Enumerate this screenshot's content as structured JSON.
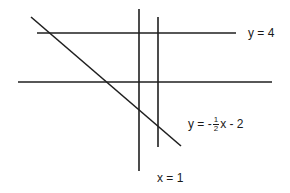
{
  "diagram": {
    "stroke_color": "#1f1f1f",
    "lines": [
      {
        "id": "line-y4",
        "x1": 37,
        "y1": 33,
        "x2": 236,
        "y2": 33
      },
      {
        "id": "line-x-axis",
        "x1": 18,
        "y1": 82,
        "x2": 272,
        "y2": 82
      },
      {
        "id": "line-y-axis",
        "x1": 139,
        "y1": 9,
        "x2": 139,
        "y2": 171
      },
      {
        "id": "line-x1",
        "x1": 158,
        "y1": 17,
        "x2": 158,
        "y2": 147
      },
      {
        "id": "line-diagonal",
        "x1": 31,
        "y1": 17,
        "x2": 181,
        "y2": 146
      }
    ],
    "labels": {
      "y4": "y = 4",
      "diag_prefix": "y = -",
      "diag_num": "1",
      "diag_den": "2",
      "diag_suffix": "x - 2",
      "x1": "x = 1"
    }
  }
}
